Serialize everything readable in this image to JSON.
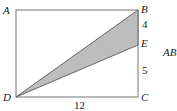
{
  "diagram": {
    "points": {
      "A": {
        "label": "A",
        "x": 16,
        "y": 10
      },
      "B": {
        "label": "B",
        "x": 138,
        "y": 10
      },
      "C": {
        "label": "C",
        "x": 138,
        "y": 97
      },
      "D": {
        "label": "D",
        "x": 16,
        "y": 97
      },
      "E": {
        "label": "E",
        "x": 138,
        "y": 45
      }
    },
    "measures": {
      "BE": "4",
      "EC": "5",
      "DC": "12"
    },
    "side_text": "AB",
    "colors": {
      "stroke": "#777777",
      "shade": "#bdbdbd"
    }
  }
}
